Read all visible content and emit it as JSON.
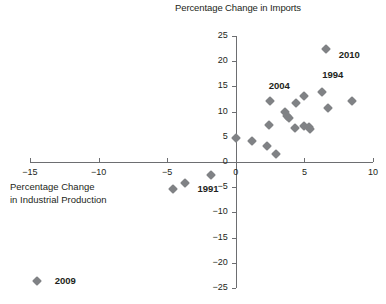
{
  "chart_data": {
    "type": "scatter",
    "title": "Percentage Change in Imports",
    "xlabel_line1": "Percentage Change",
    "xlabel_line2": "in Industrial Production",
    "ylabel": "Percentage Change in Imports",
    "xlim": [
      -15,
      10
    ],
    "ylim": [
      -25,
      25
    ],
    "xticks": [
      -15,
      -10,
      -5,
      0,
      5,
      10
    ],
    "xtick_labels": [
      "−15",
      "−10",
      "−5",
      "0",
      "5",
      "10"
    ],
    "yticks": [
      25,
      20,
      15,
      10,
      5,
      0,
      -5,
      -10,
      -15,
      -20,
      -25
    ],
    "ytick_labels": [
      "25",
      "20",
      "15",
      "10",
      "5",
      "0",
      "−5",
      "−10",
      "−15",
      "−20",
      "−25"
    ],
    "grid": false,
    "legend": "none",
    "marker": "diamond",
    "marker_color": "#808285",
    "axis_color": "#6d6e71",
    "points": [
      {
        "x": 0.0,
        "y": 4.8,
        "label": ""
      },
      {
        "x": 1.2,
        "y": 4.1,
        "label": ""
      },
      {
        "x": 2.3,
        "y": 3.1,
        "label": ""
      },
      {
        "x": 2.9,
        "y": 1.6,
        "label": ""
      },
      {
        "x": 2.4,
        "y": 7.3,
        "label": ""
      },
      {
        "x": 2.5,
        "y": 12.2,
        "label": "2004"
      },
      {
        "x": 3.6,
        "y": 9.9,
        "label": ""
      },
      {
        "x": 3.7,
        "y": 9.1,
        "label": ""
      },
      {
        "x": 3.9,
        "y": 8.7,
        "label": ""
      },
      {
        "x": 4.3,
        "y": 6.8,
        "label": ""
      },
      {
        "x": 4.4,
        "y": 11.7,
        "label": ""
      },
      {
        "x": 5.0,
        "y": 13.0,
        "label": ""
      },
      {
        "x": 5.0,
        "y": 7.1,
        "label": ""
      },
      {
        "x": 5.3,
        "y": 7.0,
        "label": ""
      },
      {
        "x": 5.4,
        "y": 6.5,
        "label": ""
      },
      {
        "x": 6.3,
        "y": 13.8,
        "label": "1994"
      },
      {
        "x": 6.6,
        "y": 22.5,
        "label": "2010"
      },
      {
        "x": 6.7,
        "y": 10.7,
        "label": ""
      },
      {
        "x": 8.5,
        "y": 12.1,
        "label": ""
      },
      {
        "x": -1.8,
        "y": -2.5,
        "label": ""
      },
      {
        "x": -3.7,
        "y": -4.1,
        "label": ""
      },
      {
        "x": -4.6,
        "y": -5.3,
        "label": "1991"
      },
      {
        "x": -14.5,
        "y": -23.6,
        "label": "2009"
      }
    ],
    "annotations": [
      {
        "text": "2010",
        "x": 7.5,
        "y": 21.3
      },
      {
        "text": "1994",
        "x": 6.3,
        "y": 17.2
      },
      {
        "text": "2004",
        "x": 2.4,
        "y": 15.0
      },
      {
        "text": "1991",
        "x": -2.8,
        "y": -5.3
      },
      {
        "text": "2009",
        "x": -13.2,
        "y": -23.6
      }
    ]
  }
}
